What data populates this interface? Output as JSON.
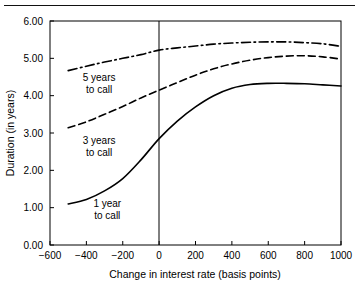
{
  "figure": {
    "name": "duration-vs-interest-rate-change",
    "top_rule": true
  },
  "chart_data": {
    "type": "line",
    "title": "",
    "xlabel": "Change in interest rate (basis points)",
    "ylabel": "Duration (in years)",
    "xlim": [
      -600,
      1000
    ],
    "ylim": [
      0.0,
      6.0
    ],
    "xticks": [
      -600,
      -400,
      -200,
      0,
      200,
      400,
      600,
      800,
      1000
    ],
    "xticklabels": [
      "−600",
      "−400",
      "−200",
      "0",
      "200",
      "400",
      "600",
      "800",
      "1000"
    ],
    "yticks": [
      0.0,
      1.0,
      2.0,
      3.0,
      4.0,
      5.0,
      6.0
    ],
    "yticklabels": [
      "0.00",
      "1.00",
      "2.00",
      "3.00",
      "4.00",
      "5.00",
      "6.00"
    ],
    "grid": false,
    "legend_position": "inline-annotations",
    "reference_lines": [
      {
        "name": "zero-rate-change",
        "axis": "x",
        "value": 0
      }
    ],
    "series": [
      {
        "name": "1 year to call",
        "label": "1 year\nto call",
        "linestyle": "solid",
        "color": "#000000",
        "x": [
          -600,
          -500,
          -400,
          -300,
          -200,
          -100,
          0,
          100,
          200,
          300,
          400,
          500,
          600,
          700,
          800,
          900,
          1000
        ],
        "y": [
          null,
          1.1,
          1.22,
          1.45,
          1.78,
          2.28,
          2.85,
          3.32,
          3.7,
          4.0,
          4.2,
          4.3,
          4.33,
          4.33,
          4.32,
          4.29,
          4.26
        ]
      },
      {
        "name": "3 years to call",
        "label": "3 years\nto call",
        "linestyle": "dashed",
        "color": "#000000",
        "x": [
          -600,
          -500,
          -400,
          -300,
          -200,
          -100,
          0,
          100,
          200,
          300,
          400,
          500,
          600,
          700,
          800,
          900,
          1000
        ],
        "y": [
          null,
          3.14,
          3.3,
          3.5,
          3.71,
          3.94,
          4.15,
          4.35,
          4.55,
          4.72,
          4.85,
          4.95,
          5.02,
          5.06,
          5.07,
          5.04,
          4.98
        ]
      },
      {
        "name": "5 years to call",
        "label": "5 years\nto call",
        "linestyle": "dashdot",
        "color": "#000000",
        "x": [
          -600,
          -500,
          -400,
          -300,
          -200,
          -100,
          0,
          100,
          200,
          300,
          400,
          500,
          600,
          700,
          800,
          900,
          1000
        ],
        "y": [
          null,
          4.67,
          4.79,
          4.9,
          5.0,
          5.1,
          5.22,
          5.28,
          5.33,
          5.38,
          5.41,
          5.43,
          5.44,
          5.44,
          5.42,
          5.39,
          5.32
        ]
      }
    ],
    "annotations": [
      {
        "name": "label-5-years-to-call",
        "lines": [
          "5 years",
          "to call"
        ],
        "x": -330,
        "y": 4.38
      },
      {
        "name": "label-3-years-to-call",
        "lines": [
          "3 years",
          "to call"
        ],
        "x": -330,
        "y": 2.7
      },
      {
        "name": "label-1-year-to-call",
        "lines": [
          "1 year",
          "to call"
        ],
        "x": -285,
        "y": 1.02
      }
    ]
  }
}
